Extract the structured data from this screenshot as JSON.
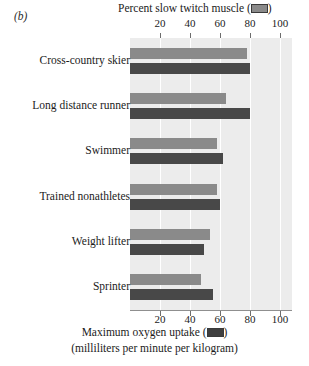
{
  "panel": {
    "label": "(b)"
  },
  "titles": {
    "top": "Percent slow twitch muscle (",
    "top_close": ")",
    "bottom": "Maximum oxygen uptake (",
    "bottom_close": ")",
    "bottom_sub": "(milliliters per minute per kilogram)"
  },
  "legend": {
    "slow_twitch_swatch": "light-gray-swatch",
    "oxygen_swatch": "dark-gray-swatch",
    "slow_twitch_color": "#8a8a8a",
    "oxygen_color": "#484848"
  },
  "axis": {
    "ticks": [
      20,
      40,
      60,
      80,
      100
    ],
    "tick_labels": [
      "20",
      "40",
      "60",
      "80",
      "100"
    ],
    "min": 0,
    "max": 108
  },
  "chart_data": {
    "type": "bar",
    "orientation": "horizontal",
    "xlabel": "Maximum oxygen uptake (milliliters per minute per kilogram)",
    "ylabel": "",
    "xlim": [
      0,
      108
    ],
    "grid": true,
    "legend_position": "in-axis-titles",
    "categories": [
      "Cross-country skier",
      "Long distance runner",
      "Swimmer",
      "Trained nonathletes",
      "Weight lifter",
      "Sprinter"
    ],
    "series": [
      {
        "name": "Percent slow twitch muscle",
        "color": "#8a8a8a",
        "values": [
          78,
          64,
          58,
          58,
          53,
          47
        ]
      },
      {
        "name": "Maximum oxygen uptake",
        "color": "#484848",
        "values": [
          80,
          80,
          62,
          60,
          49,
          55
        ]
      }
    ]
  }
}
